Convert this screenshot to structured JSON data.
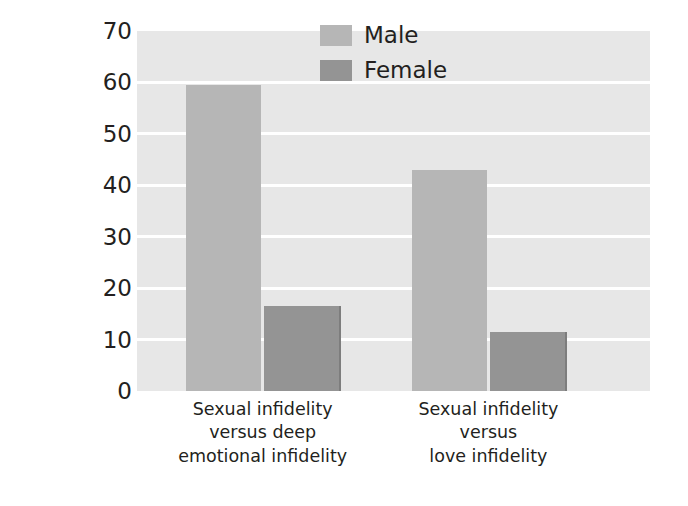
{
  "chart_data": {
    "type": "bar",
    "title": "",
    "subtitle": "",
    "xlabel": "",
    "ylabel": "Percentage reporting more distress to sexual infidelity",
    "ylabel_lines": [
      "Percentage reporting more",
      "distress to sexual infidelity"
    ],
    "ylim": [
      0,
      70
    ],
    "yticks": [
      0,
      10,
      20,
      30,
      40,
      50,
      60,
      70
    ],
    "ytick_labels": [
      "0",
      "10",
      "20",
      "30",
      "40",
      "50",
      "60",
      "70"
    ],
    "grid": "horizontal-white-on-gray",
    "legend_position": "top-right-inside",
    "categories": [
      "Sexual infidelity versus deep emotional infidelity",
      "Sexual infidelity versus love infidelity"
    ],
    "category_lines": [
      [
        "Sexual infidelity",
        "versus deep",
        "emotional infidelity"
      ],
      [
        "Sexual infidelity",
        "versus",
        "love infidelity"
      ]
    ],
    "series": [
      {
        "name": "Male",
        "color": "#b6b6b6",
        "values": [
          59.5,
          43.0
        ]
      },
      {
        "name": "Female",
        "color": "#949494",
        "values": [
          16.5,
          11.5
        ]
      }
    ]
  },
  "legend": {
    "items": [
      {
        "label": "Male"
      },
      {
        "label": "Female"
      }
    ]
  },
  "colors": {
    "plot_background": "#e7e7e7",
    "gridline": "#ffffff",
    "male_bar": "#b6b6b6",
    "female_bar": "#949494",
    "text": "#231f20",
    "page_background": "#ffffff"
  }
}
